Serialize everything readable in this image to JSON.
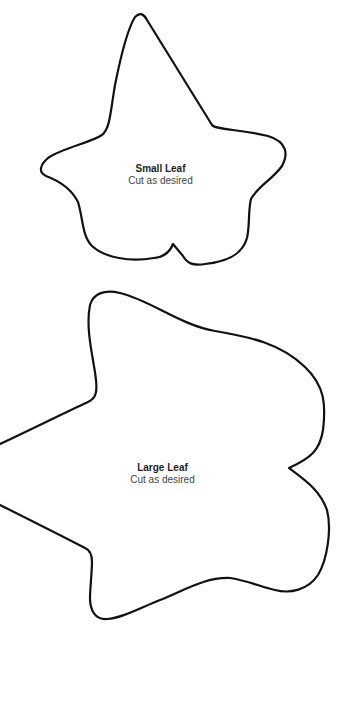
{
  "templates": [
    {
      "title": "Small Leaf",
      "subtitle": "Cut as desired"
    },
    {
      "title": "Large Leaf",
      "subtitle": "Cut as desired"
    }
  ],
  "colors": {
    "outline": "#111111",
    "background": "#ffffff"
  }
}
